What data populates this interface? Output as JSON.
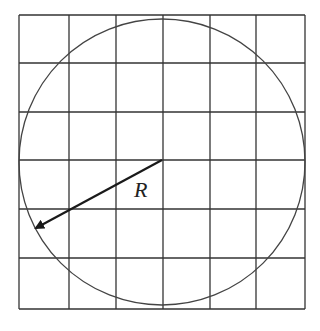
{
  "diagram": {
    "type": "circle-inscribed-in-grid",
    "grid": {
      "columns": 6,
      "rows": 6,
      "x_lines": [
        19,
        69,
        116,
        163,
        210,
        256,
        305
      ],
      "y_lines": [
        15,
        63,
        112,
        160,
        209,
        258,
        309
      ],
      "stroke": "#333333"
    },
    "circle": {
      "cx": 162,
      "cy": 162,
      "r": 143,
      "stroke": "#444444"
    },
    "radius_arrow": {
      "x1": 162,
      "y1": 160,
      "x2": 36,
      "y2": 228,
      "stroke": "#1a1a1a"
    },
    "label": {
      "text": "R",
      "x": 134,
      "y": 197
    }
  }
}
